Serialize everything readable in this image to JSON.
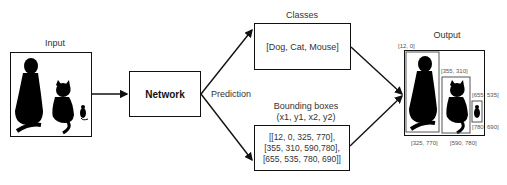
{
  "input": {
    "label": "Input"
  },
  "network": {
    "label": "Network"
  },
  "prediction": {
    "label": "Prediction"
  },
  "classes": {
    "title": "Classes",
    "value": "[Dog, Cat, Mouse]"
  },
  "bounding_boxes": {
    "title_line1": "Bounding boxes",
    "title_line2": "(x1, y1, x2, y2)",
    "lines": [
      "[[12, 0, 325, 770],",
      "[355, 310, 590,780],",
      "[655, 535, 780, 690]]"
    ]
  },
  "output": {
    "label": "Output",
    "annotations": {
      "dog_tl": "[12, 0]",
      "dog_br": "[325, 770]",
      "cat_tl": "[355, 310]",
      "cat_br": "[590, 780]",
      "mouse_tl": "[655, 535]",
      "mouse_br": "[780, 690]"
    }
  },
  "colors": {
    "line": "#111111",
    "text": "#333333",
    "bbox": "#555555"
  }
}
